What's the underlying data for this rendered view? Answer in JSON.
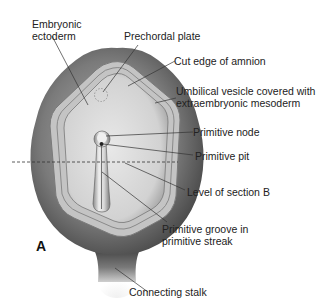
{
  "figure": {
    "panel_label": "A",
    "labels": {
      "embryonic_ectoderm_line1": "Embryonic",
      "embryonic_ectoderm_line2": "ectoderm",
      "prechordal_plate": "Prechordal plate",
      "cut_edge_amnion": "Cut edge of amnion",
      "umbilical_vesicle_line1": "Umbilical vesicle covered with",
      "umbilical_vesicle_line2": "extraembryonic mesoderm",
      "primitive_node": "Primitive node",
      "primitive_pit": "Primitive pit",
      "level_section_b": "Level of section B",
      "primitive_groove_line1": "Primitive groove in",
      "primitive_groove_line2": "primitive streak",
      "connecting_stalk": "Connecting stalk"
    },
    "colors": {
      "vesicle_dark": "#4a4a4a",
      "vesicle_mid": "#8a8a8a",
      "amnion_band": "#bdbdbd",
      "disc_light": "#dcdcdc",
      "leader_line": "#333333",
      "text": "#222222"
    }
  }
}
